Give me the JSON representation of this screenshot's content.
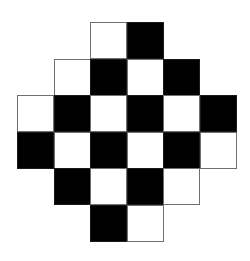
{
  "diagram": {
    "title": "",
    "origin": {
      "x": 17,
      "y": 22
    },
    "cell_size": 36.5,
    "colors": {
      "black": "#000000",
      "white": "#ffffff",
      "border": "#6f6f6f"
    },
    "cells": [
      {
        "row": 0,
        "col": 2,
        "color": "white"
      },
      {
        "row": 0,
        "col": 3,
        "color": "black"
      },
      {
        "row": 1,
        "col": 1,
        "color": "white"
      },
      {
        "row": 1,
        "col": 2,
        "color": "black"
      },
      {
        "row": 1,
        "col": 3,
        "color": "white"
      },
      {
        "row": 1,
        "col": 4,
        "color": "black"
      },
      {
        "row": 2,
        "col": 0,
        "color": "white"
      },
      {
        "row": 2,
        "col": 1,
        "color": "black"
      },
      {
        "row": 2,
        "col": 2,
        "color": "white"
      },
      {
        "row": 2,
        "col": 3,
        "color": "black"
      },
      {
        "row": 2,
        "col": 4,
        "color": "white"
      },
      {
        "row": 2,
        "col": 5,
        "color": "black"
      },
      {
        "row": 3,
        "col": 0,
        "color": "black"
      },
      {
        "row": 3,
        "col": 1,
        "color": "white"
      },
      {
        "row": 3,
        "col": 2,
        "color": "black"
      },
      {
        "row": 3,
        "col": 3,
        "color": "white"
      },
      {
        "row": 3,
        "col": 4,
        "color": "black"
      },
      {
        "row": 3,
        "col": 5,
        "color": "white"
      },
      {
        "row": 4,
        "col": 1,
        "color": "black"
      },
      {
        "row": 4,
        "col": 2,
        "color": "white"
      },
      {
        "row": 4,
        "col": 3,
        "color": "black"
      },
      {
        "row": 4,
        "col": 4,
        "color": "white"
      },
      {
        "row": 5,
        "col": 2,
        "color": "black"
      },
      {
        "row": 5,
        "col": 3,
        "color": "white"
      }
    ]
  }
}
